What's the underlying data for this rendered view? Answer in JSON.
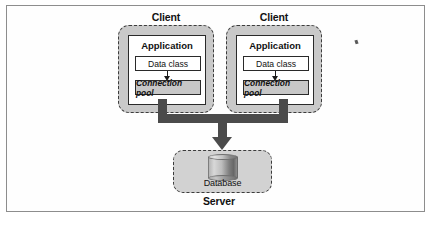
{
  "figure": {
    "title_alt": "Connection pooling architecture diagram",
    "background": "#ffffff",
    "frame_color": "#8d8d8d"
  },
  "colors": {
    "client_fill": "#c9c9c9",
    "app_fill": "#ffffff",
    "pool_fill": "#c7c7c7",
    "server_fill": "#d2d2d2",
    "pipe": "#4b4b4b",
    "text": "#111111"
  },
  "clients": [
    {
      "title": "Client",
      "application": {
        "title": "Application",
        "data_class": "Data class",
        "connection_pool": "Connection pool"
      }
    },
    {
      "title": "Client",
      "application": {
        "title": "Application",
        "data_class": "Data class",
        "connection_pool": "Connection pool"
      }
    }
  ],
  "server": {
    "title": "Server",
    "database_label": "Database"
  }
}
